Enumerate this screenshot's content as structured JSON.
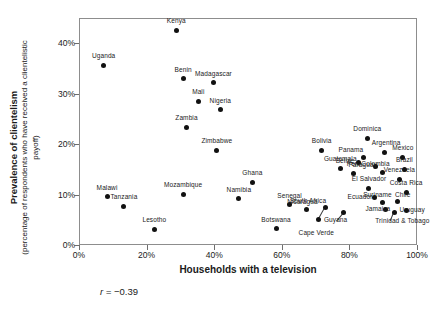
{
  "chart_data": {
    "type": "scatter",
    "title": "",
    "xlabel": "Households with a television",
    "ylabel_main": "Prevalence of clientelism",
    "ylabel_sub": "(percentage of respondents who have received a clientelistic payoff)",
    "xlim": [
      0,
      100
    ],
    "ylim": [
      0,
      45
    ],
    "xticks": [
      "0%",
      "20%",
      "40%",
      "60%",
      "80%",
      "100%"
    ],
    "xtick_values": [
      0,
      20,
      40,
      60,
      80,
      100
    ],
    "yticks": [
      "0%",
      "10%",
      "20%",
      "30%",
      "40%"
    ],
    "ytick_values": [
      0,
      10,
      20,
      30,
      40
    ],
    "grid": false,
    "legend": "none",
    "annotation_r": "r = ",
    "annotation_r_value": "−0.39",
    "point_color": "#111111",
    "frame_color": "#8d8d8d",
    "points": [
      {
        "label": "Kenya",
        "x": 28.5,
        "y": 42.8,
        "lx": 0,
        "ly": -9
      },
      {
        "label": "Uganda",
        "x": 7.0,
        "y": 35.8,
        "lx": 0,
        "ly": -9
      },
      {
        "label": "Benin",
        "x": 30.5,
        "y": 33.2,
        "lx": 0,
        "ly": -9
      },
      {
        "label": "Madagascar",
        "x": 39.5,
        "y": 32.4,
        "lx": 0,
        "ly": -9
      },
      {
        "label": "Mali",
        "x": 35.0,
        "y": 28.7,
        "lx": 0,
        "ly": -9
      },
      {
        "label": "Nigeria",
        "x": 41.5,
        "y": 27.0,
        "lx": 0,
        "ly": -9
      },
      {
        "label": "Zambia",
        "x": 31.5,
        "y": 23.5,
        "lx": 0,
        "ly": -9
      },
      {
        "label": "Zimbabwe",
        "x": 40.5,
        "y": 19.0,
        "lx": 0,
        "ly": -9
      },
      {
        "label": "Dominica",
        "x": 85.0,
        "y": 21.4,
        "lx": 0,
        "ly": -9
      },
      {
        "label": "Bolivia",
        "x": 71.5,
        "y": 19.0,
        "lx": 0,
        "ly": -9
      },
      {
        "label": "Argentina",
        "x": 90.0,
        "y": 18.6,
        "lx": 2,
        "ly": -9
      },
      {
        "label": "Mexico",
        "x": 95.5,
        "y": 17.6,
        "lx": 0,
        "ly": -9
      },
      {
        "label": "Panama",
        "x": 84.0,
        "y": 17.5,
        "lx": -13,
        "ly": -8
      },
      {
        "label": "Belize",
        "x": 82.5,
        "y": 16.6,
        "lx": -14,
        "ly": -1
      },
      {
        "label": "Paraguay",
        "x": 87.5,
        "y": 15.8,
        "lx": -13,
        "ly": -1
      },
      {
        "label": "Brazil",
        "x": 96.0,
        "y": 15.2,
        "lx": 0,
        "ly": -9
      },
      {
        "label": "Colombia",
        "x": 89.5,
        "y": 14.6,
        "lx": -7,
        "ly": -8
      },
      {
        "label": "Guatemala",
        "x": 77.0,
        "y": 15.4,
        "lx": 0,
        "ly": -9
      },
      {
        "label": "Peru",
        "x": 81.0,
        "y": 14.4,
        "lx": 0,
        "ly": -9
      },
      {
        "label": "Venezuela",
        "x": 94.5,
        "y": 13.2,
        "lx": 0,
        "ly": -9
      },
      {
        "label": "Ghana",
        "x": 51.0,
        "y": 12.6,
        "lx": 0,
        "ly": -9
      },
      {
        "label": "El Salvador",
        "x": 85.5,
        "y": 11.4,
        "lx": 0,
        "ly": -9
      },
      {
        "label": "Costa Rica",
        "x": 96.5,
        "y": 10.7,
        "lx": 0,
        "ly": -9
      },
      {
        "label": "Ecuador",
        "x": 87.0,
        "y": 9.6,
        "lx": -14,
        "ly": -1
      },
      {
        "label": "Suriname",
        "x": 89.5,
        "y": 8.6,
        "lx": -5,
        "ly": -8
      },
      {
        "label": "Chile",
        "x": 94.0,
        "y": 8.8,
        "lx": 5,
        "ly": -7
      },
      {
        "label": "Uruguay",
        "x": 96.5,
        "y": 7.0,
        "lx": 6,
        "ly": -1
      },
      {
        "label": "Jamaica",
        "x": 90.5,
        "y": 7.2,
        "lx": -8,
        "ly": -1
      },
      {
        "label": "Trinidad & Tobago",
        "x": 93.0,
        "y": 6.6,
        "lx": 8,
        "ly": 8
      },
      {
        "label": "Senegal",
        "x": 62.0,
        "y": 8.2,
        "lx": 0,
        "ly": -9
      },
      {
        "label": "Nicaragua",
        "x": 67.0,
        "y": 7.2,
        "lx": -4,
        "ly": -8
      },
      {
        "label": "South Africa",
        "x": 72.5,
        "y": 7.6,
        "lx": -17,
        "ly": -7
      },
      {
        "label": "Guyana",
        "x": 78.0,
        "y": 6.6,
        "lx": -8,
        "ly": 7
      },
      {
        "label": "Cape Verde",
        "x": 70.5,
        "y": 5.2,
        "lx": -2,
        "ly": 13
      },
      {
        "label": "Namibia",
        "x": 47.0,
        "y": 9.4,
        "lx": 0,
        "ly": -9
      },
      {
        "label": "Mozambique",
        "x": 30.5,
        "y": 10.3,
        "lx": 0,
        "ly": -9
      },
      {
        "label": "Malawi",
        "x": 8.0,
        "y": 9.8,
        "lx": 0,
        "ly": -9
      },
      {
        "label": "Tanzania",
        "x": 13.0,
        "y": 7.9,
        "lx": 0,
        "ly": -9
      },
      {
        "label": "Lesotho",
        "x": 22.0,
        "y": 3.3,
        "lx": 0,
        "ly": -9
      },
      {
        "label": "Botswana",
        "x": 58.0,
        "y": 3.4,
        "lx": 0,
        "ly": -9
      }
    ],
    "leaders": [
      {
        "from_x": 72.5,
        "from_y": 7.6,
        "to_x": 70.5,
        "to_y": 5.2
      },
      {
        "from_x": 78.0,
        "from_y": 6.6,
        "to_x": 76.0,
        "to_y": 5.0
      },
      {
        "from_x": 93.0,
        "from_y": 6.6,
        "to_x": 92.0,
        "to_y": 5.0
      }
    ]
  }
}
